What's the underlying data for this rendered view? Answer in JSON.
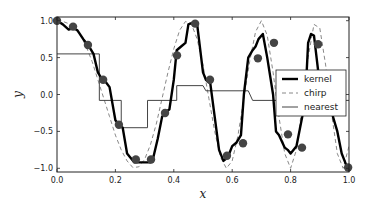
{
  "chart_data": {
    "type": "line",
    "title": "",
    "xlabel": "x",
    "ylabel": "y",
    "xlim": [
      0.0,
      1.0
    ],
    "ylim": [
      -1.05,
      1.05
    ],
    "xticks": [
      "0.0",
      "0.2",
      "0.4",
      "0.6",
      "0.8",
      "1.0"
    ],
    "xtick_values": [
      0.0,
      0.2,
      0.4,
      0.6,
      0.8,
      1.0
    ],
    "yticks": [
      "-1.0",
      "-0.5",
      "0.0",
      "0.5",
      "1.0"
    ],
    "ytick_values": [
      -1.0,
      -0.5,
      0.0,
      0.5,
      1.0
    ],
    "grid": false,
    "legend_position": "center-right",
    "series": [
      {
        "name": "kernel",
        "style": "solid-thick",
        "color": "#000000",
        "x": [
          0.0,
          0.02,
          0.04,
          0.055,
          0.07,
          0.09,
          0.11,
          0.125,
          0.14,
          0.155,
          0.165,
          0.18,
          0.2,
          0.21,
          0.225,
          0.24,
          0.265,
          0.29,
          0.32,
          0.33,
          0.345,
          0.36,
          0.37,
          0.385,
          0.4,
          0.41,
          0.425,
          0.44,
          0.45,
          0.47,
          0.48,
          0.5,
          0.51,
          0.525,
          0.54,
          0.555,
          0.57,
          0.585,
          0.6,
          0.615,
          0.63,
          0.64,
          0.655,
          0.67,
          0.68,
          0.69,
          0.705,
          0.72,
          0.74,
          0.75,
          0.76,
          0.78,
          0.79,
          0.8,
          0.82,
          0.84,
          0.855,
          0.86,
          0.87,
          0.88,
          0.895,
          0.91,
          0.93,
          0.945,
          0.96,
          0.975,
          0.99,
          1.0
        ],
        "y": [
          1.0,
          0.95,
          0.88,
          0.9,
          0.87,
          0.75,
          0.65,
          0.55,
          0.3,
          0.2,
          0.18,
          0.1,
          -0.35,
          -0.4,
          -0.45,
          -0.8,
          -0.92,
          -0.92,
          -0.92,
          -0.85,
          -0.6,
          -0.3,
          -0.25,
          -0.2,
          0.2,
          0.6,
          0.65,
          0.7,
          0.95,
          0.98,
          0.95,
          0.3,
          0.2,
          0.15,
          -0.3,
          -0.75,
          -0.9,
          -0.85,
          -0.7,
          -0.65,
          -0.55,
          0.0,
          0.5,
          0.6,
          0.65,
          0.75,
          0.82,
          0.5,
          0.0,
          -0.5,
          -0.55,
          -0.72,
          -0.75,
          -0.8,
          -0.7,
          -0.3,
          0.3,
          0.7,
          0.82,
          0.8,
          0.3,
          0.2,
          0.15,
          -0.3,
          -0.5,
          -0.8,
          -0.95,
          -1.0
        ]
      },
      {
        "name": "chirp",
        "style": "dashed",
        "color": "#888888",
        "x": [
          0.0,
          0.02,
          0.04,
          0.06,
          0.08,
          0.1,
          0.12,
          0.14,
          0.16,
          0.18,
          0.2,
          0.22,
          0.24,
          0.26,
          0.28,
          0.3,
          0.32,
          0.34,
          0.36,
          0.38,
          0.4,
          0.42,
          0.44,
          0.46,
          0.48,
          0.5,
          0.52,
          0.54,
          0.56,
          0.58,
          0.6,
          0.62,
          0.64,
          0.66,
          0.68,
          0.7,
          0.72,
          0.74,
          0.76,
          0.78,
          0.8,
          0.82,
          0.84,
          0.86,
          0.88,
          0.9,
          0.92,
          0.94,
          0.96,
          0.98,
          1.0
        ],
        "y": [
          1.0,
          0.99,
          0.96,
          0.9,
          0.8,
          0.65,
          0.45,
          0.2,
          -0.05,
          -0.3,
          -0.55,
          -0.75,
          -0.9,
          -0.99,
          -0.98,
          -0.88,
          -0.68,
          -0.4,
          -0.05,
          0.3,
          0.62,
          0.87,
          0.99,
          0.96,
          0.75,
          0.4,
          -0.05,
          -0.5,
          -0.85,
          -1.0,
          -0.9,
          -0.55,
          -0.05,
          0.45,
          0.85,
          1.0,
          0.8,
          0.3,
          -0.3,
          -0.8,
          -1.0,
          -0.75,
          -0.15,
          0.5,
          0.95,
          0.9,
          0.4,
          -0.25,
          -0.8,
          -1.0,
          -0.7
        ]
      },
      {
        "name": "nearest",
        "style": "solid-thin",
        "color": "#444444",
        "x": [
          0.0,
          0.145,
          0.145,
          0.22,
          0.22,
          0.31,
          0.31,
          0.41,
          0.41,
          0.5,
          0.51,
          0.655,
          0.67,
          0.8,
          1.0
        ],
        "y": [
          0.55,
          0.55,
          -0.08,
          -0.08,
          -0.45,
          -0.45,
          -0.08,
          -0.08,
          0.12,
          0.12,
          0.05,
          0.05,
          -0.08,
          -0.08,
          -0.08
        ]
      }
    ],
    "markers": {
      "name": "samples",
      "color": "#444444",
      "x": [
        0.0,
        0.055,
        0.106,
        0.158,
        0.212,
        0.27,
        0.322,
        0.37,
        0.411,
        0.473,
        0.524,
        0.582,
        0.637,
        0.688,
        0.743,
        0.791,
        0.839,
        0.894,
        0.949,
        0.997
      ],
      "y": [
        1.0,
        0.92,
        0.67,
        0.2,
        -0.41,
        -0.88,
        -0.88,
        -0.25,
        0.53,
        0.96,
        0.2,
        -0.83,
        -0.66,
        0.49,
        0.7,
        -0.54,
        -0.72,
        0.68,
        0.25,
        -0.99
      ]
    },
    "legend": [
      {
        "label": "kernel",
        "style": "solid-thick"
      },
      {
        "label": "chirp",
        "style": "dashed"
      },
      {
        "label": "nearest",
        "style": "solid-thin"
      }
    ]
  }
}
